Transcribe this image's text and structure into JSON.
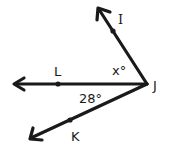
{
  "diagram": {
    "type": "angle-diagram",
    "vertex": {
      "label": "J",
      "x": 147,
      "y": 84
    },
    "rays": [
      {
        "name": "JI",
        "point_label": "I",
        "tip": [
          98,
          8
        ],
        "point": [
          113,
          31
        ]
      },
      {
        "name": "JL",
        "point_label": "L",
        "tip": [
          12,
          84
        ],
        "point": [
          58,
          84
        ]
      },
      {
        "name": "JK",
        "point_label": "K",
        "tip": [
          30,
          139
        ],
        "point": [
          70,
          120
        ]
      }
    ],
    "labels": {
      "I": "I",
      "L": "L",
      "J": "J",
      "K": "K",
      "angle_x": "x°",
      "angle_28": "28°"
    },
    "angles": [
      {
        "between": [
          "JI",
          "JL"
        ],
        "measure": "x°"
      },
      {
        "between": [
          "JL",
          "JK"
        ],
        "measure": "28°"
      }
    ],
    "colors": {
      "stroke": "#1a1a1a",
      "background": "#ffffff"
    }
  }
}
